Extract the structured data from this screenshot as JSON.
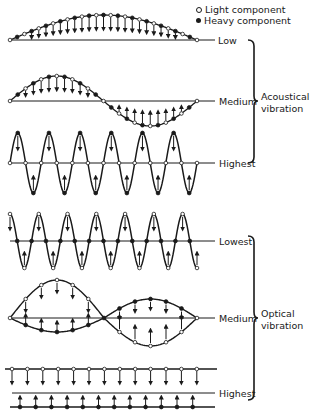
{
  "legend": {
    "light": "Light component",
    "heavy": "Heavy component"
  },
  "groups": {
    "acoustical": {
      "label_line1": "Acoustical",
      "label_line2": "vibration",
      "modes": [
        {
          "label": "Low"
        },
        {
          "label": "Medium"
        },
        {
          "label": "Highest"
        }
      ]
    },
    "optical": {
      "label_line1": "Optical",
      "label_line2": "vibration",
      "modes": [
        {
          "label": "Lowest"
        },
        {
          "label": "Medium"
        },
        {
          "label": "Highest"
        }
      ]
    }
  },
  "colors": {
    "ink": "#1a1a1a",
    "background": "#ffffff"
  }
}
